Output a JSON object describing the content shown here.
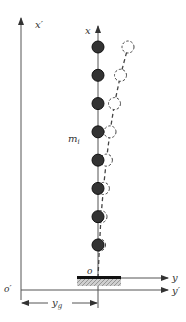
{
  "diagram": {
    "labels": {
      "x_prime": "x′",
      "x": "x",
      "mass": "m",
      "mass_subscript": "i",
      "origin": "o",
      "origin_prime": "o′",
      "y": "y",
      "y_prime": "y′",
      "base_disp": "y",
      "base_disp_subscript": "g"
    },
    "mass_count": 8,
    "deformed_offsets": [
      0.05,
      0.1,
      0.18,
      0.28,
      0.4,
      0.55,
      0.75,
      1.0
    ],
    "colors": {
      "axis": "#555555",
      "mass_fill": "#333333",
      "deformed": "#444444",
      "base_plate": "#111111",
      "ground_hatch": "#888888"
    }
  }
}
